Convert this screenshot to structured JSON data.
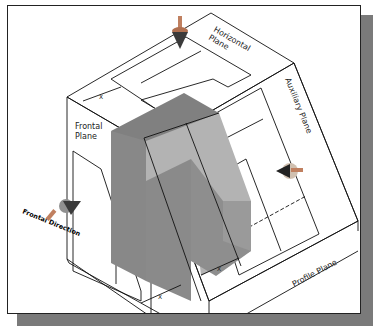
{
  "diagram": {
    "labels": {
      "horizontal_plane": "Horizontal Plane",
      "horizontal_line1": "Horizontal",
      "horizontal_line2": "Plane",
      "frontal_line1": "Frontal",
      "frontal_line2": "Plane",
      "auxiliary_plane": "Auxiliary Plane",
      "profile_plane": "Profile Plane",
      "frontal_direction": "Frontal Direction"
    },
    "dimensions": {
      "top": "X",
      "bottom": "X",
      "right": "X"
    },
    "colors": {
      "object_dark": "#858585",
      "object_mid": "#9a9a9a",
      "object_light": "#b8b8b8",
      "frame_border": "#222222",
      "shadow": "#7a7a7a",
      "arrow_cone": "#3a3a3a",
      "arrow_body": "#c08060"
    }
  }
}
